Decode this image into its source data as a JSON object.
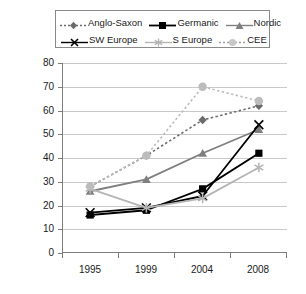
{
  "chart_data": {
    "type": "line",
    "title": "",
    "xlabel": "",
    "ylabel": "",
    "categories": [
      "1995",
      "1999",
      "2004",
      "2008"
    ],
    "ylim": [
      0,
      80
    ],
    "yticks": [
      0,
      10,
      20,
      30,
      40,
      50,
      60,
      70,
      80
    ],
    "grid": true,
    "legend_position": "top",
    "series": [
      {
        "name": "Anglo-Saxon",
        "values": [
          28,
          41,
          56,
          62
        ],
        "color": "#6b6b6b",
        "line_style": "dotted",
        "marker": "diamond"
      },
      {
        "name": "Germanic",
        "values": [
          16,
          18,
          27,
          42
        ],
        "color": "#000000",
        "line_style": "solid",
        "marker": "square"
      },
      {
        "name": "Nordic",
        "values": [
          26,
          31,
          42,
          52
        ],
        "color": "#7f7f7f",
        "line_style": "solid",
        "marker": "triangle"
      },
      {
        "name": "SW Europe",
        "values": [
          17,
          19,
          24,
          54
        ],
        "color": "#000000",
        "line_style": "solid",
        "marker": "x"
      },
      {
        "name": "S Europe",
        "values": [
          27,
          19,
          23,
          36
        ],
        "color": "#b5b5b5",
        "line_style": "solid",
        "marker": "star"
      },
      {
        "name": "CEE",
        "values": [
          28,
          41,
          70,
          64
        ],
        "color": "#bcbcbc",
        "line_style": "dotted",
        "marker": "circle"
      }
    ]
  },
  "legend": {
    "rows": [
      [
        "Anglo-Saxon",
        "Germanic",
        "Nordic"
      ],
      [
        "SW Europe",
        "S Europe",
        "CEE"
      ]
    ]
  },
  "axes": {
    "y_tick_labels": [
      "80",
      "70",
      "60",
      "50",
      "40",
      "30",
      "20",
      "10",
      "0"
    ],
    "x_tick_labels": [
      "1995",
      "1999",
      "2004",
      "2008"
    ]
  }
}
